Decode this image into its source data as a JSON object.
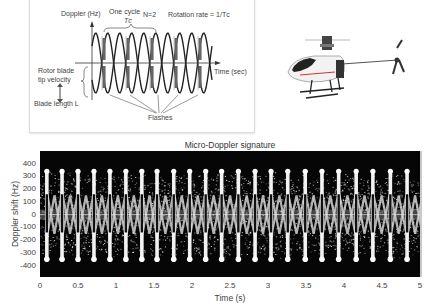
{
  "diagram": {
    "y_axis_label": "Doppler (Hz)",
    "one_cycle_label": "One cycle",
    "tc_label": "Tᴄ",
    "n_label": "N=2",
    "rotation_rate_label": "Rotation rate = 1/Tᴄ",
    "x_axis_label": "Time (sec)",
    "rotor_tip_label_1": "Rotor blade",
    "rotor_tip_label_2": "tip velocity",
    "blade_length_label": "Blade length L",
    "flashes_label": "Flashes",
    "blade_labels_top": [
      "Blade No.1",
      "Blade No.2",
      "Blade No.1",
      "Blade No.2",
      "Blade No.1"
    ],
    "blade_labels_bottom": [
      "Blade No.2",
      "Blade No.1",
      "Blade No.2",
      "Blade No.1",
      "Blade No.2"
    ]
  },
  "image": {
    "subject": "helicopter-photo"
  },
  "chart_data": {
    "type": "heatmap",
    "title": "Micro-Doppler signature",
    "xlabel": "Time (s)",
    "ylabel": "Doppler shift (Hz)",
    "xlim": [
      0,
      5
    ],
    "ylim": [
      -490,
      500
    ],
    "x_ticks": [
      "0",
      "0.5",
      "1",
      "1.5",
      "2",
      "2.5",
      "3",
      "3.5",
      "4",
      "4.5",
      "5"
    ],
    "y_ticks": [
      "400",
      "300",
      "200",
      "100",
      "0",
      "-100",
      "-200",
      "-300",
      "-400"
    ],
    "grid": false,
    "colormap": "grayscale",
    "flash_count": 23,
    "flash_period_s": 0.215,
    "first_flash_s": 0.09,
    "flash_doppler_hz": [
      340,
      -350
    ],
    "blade_flash_times_s": [
      0.09,
      0.29,
      0.5,
      0.71,
      0.92,
      1.13,
      1.34,
      1.54,
      1.76,
      1.97,
      2.18,
      2.39,
      2.61,
      2.83,
      3.04,
      3.26,
      3.49,
      3.71,
      3.93,
      4.16,
      4.38,
      4.61,
      4.83
    ],
    "body_doppler_band_hz": [
      -40,
      40
    ],
    "hub_vertical_bar_hz": [
      -140,
      160
    ]
  }
}
